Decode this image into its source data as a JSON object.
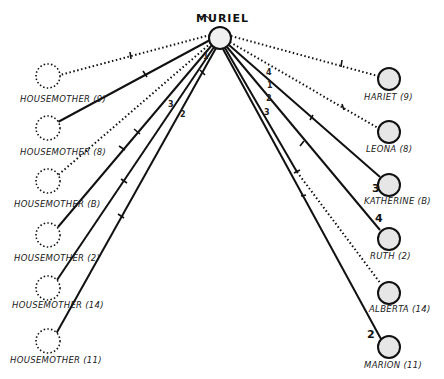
{
  "diagram": {
    "center": {
      "name": "MURIEL",
      "x": 220,
      "y": 38,
      "r": 11
    },
    "left_nodes": [
      {
        "label": "HOUSEMOTHER (9)",
        "x": 48,
        "y": 76,
        "style": "dotted"
      },
      {
        "label": "HOUSEMOTHER (8)",
        "x": 48,
        "y": 128,
        "style": "dotted"
      },
      {
        "label": "HOUSEMOTHER (B)",
        "x": 48,
        "y": 181,
        "style": "dotted"
      },
      {
        "label": "HOUSEMOTHER (2)",
        "x": 48,
        "y": 235,
        "style": "dotted"
      },
      {
        "label": "HOUSEMOTHER (14)",
        "x": 48,
        "y": 288,
        "style": "dotted"
      },
      {
        "label": "HOUSEMOTHER (11)",
        "x": 48,
        "y": 341,
        "style": "dotted"
      }
    ],
    "right_nodes": [
      {
        "label": "HARIET (9)",
        "x": 389,
        "y": 79,
        "style": "solid"
      },
      {
        "label": "LEONA (8)",
        "x": 389,
        "y": 132,
        "style": "solid"
      },
      {
        "label": "KATHERINE (B)",
        "x": 389,
        "y": 185,
        "style": "solid"
      },
      {
        "label": "RUTH (2)",
        "x": 389,
        "y": 239,
        "style": "solid"
      },
      {
        "label": "ALBERTA (14)",
        "x": 389,
        "y": 293,
        "style": "solid"
      },
      {
        "label": "MARION (11)",
        "x": 389,
        "y": 347,
        "style": "solid"
      }
    ],
    "edge_numbers": [
      {
        "text": "1",
        "x": 203,
        "y": 59
      },
      {
        "text": "3",
        "x": 168,
        "y": 107
      },
      {
        "text": "2",
        "x": 180,
        "y": 117
      },
      {
        "text": "4",
        "x": 266,
        "y": 75
      },
      {
        "text": "1",
        "x": 267,
        "y": 88
      },
      {
        "text": "2",
        "x": 266,
        "y": 101
      },
      {
        "text": "3",
        "x": 264,
        "y": 115
      }
    ],
    "node_numbers": [
      {
        "text": "3",
        "x": 372,
        "y": 192
      },
      {
        "text": "4",
        "x": 375,
        "y": 221
      },
      {
        "text": "2",
        "x": 367,
        "y": 338
      }
    ]
  }
}
